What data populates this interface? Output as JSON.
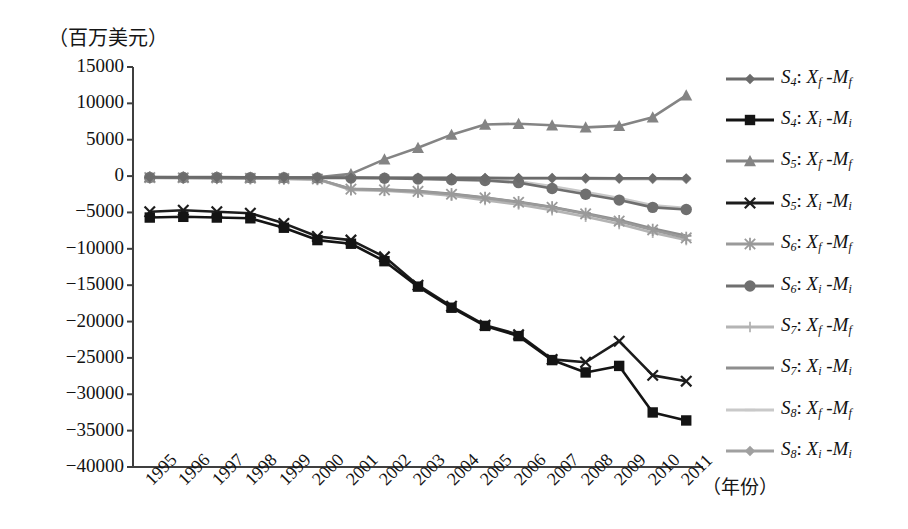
{
  "axis": {
    "unit_label": "（百万美元）",
    "x_axis_title": "（年份）",
    "y_ticks": [
      "15000",
      "10000",
      "5000",
      "0",
      "-5000",
      "-10000",
      "-15000",
      "-20000",
      "-25000",
      "-30000",
      "-35000",
      "-40000"
    ],
    "x_ticks": [
      "1995",
      "1996",
      "1997",
      "1998",
      "1999",
      "2000",
      "2001",
      "2002",
      "2003",
      "2004",
      "2005",
      "2006",
      "2007",
      "2008",
      "2009",
      "2010",
      "2011"
    ]
  },
  "legend": {
    "items": [
      {
        "label": "S4: Xf -Mf",
        "base": "S",
        "sub": "4",
        "num": "X",
        "numsub": "f",
        "den": "M",
        "densub": "f",
        "marker": "diamond",
        "color": "#6b6b6b"
      },
      {
        "label": "S4: Xi -Mi",
        "base": "S",
        "sub": "4",
        "num": "X",
        "numsub": "i",
        "den": "M",
        "densub": "i",
        "marker": "square",
        "color": "#141414"
      },
      {
        "label": "S5: Xf -Mf",
        "base": "S",
        "sub": "5",
        "num": "X",
        "numsub": "f",
        "den": "M",
        "densub": "f",
        "marker": "triangle",
        "color": "#848484"
      },
      {
        "label": "S5: Xi -Mi",
        "base": "S",
        "sub": "5",
        "num": "X",
        "numsub": "i",
        "den": "M",
        "densub": "i",
        "marker": "x",
        "color": "#1c1c1c"
      },
      {
        "label": "S6: Xf -Mf",
        "base": "S",
        "sub": "6",
        "num": "X",
        "numsub": "f",
        "den": "M",
        "densub": "f",
        "marker": "asterisk",
        "color": "#9a9a9a"
      },
      {
        "label": "S6: Xi -Mi",
        "base": "S",
        "sub": "6",
        "num": "X",
        "numsub": "i",
        "den": "M",
        "densub": "i",
        "marker": "circle",
        "color": "#6f6f6f"
      },
      {
        "label": "S7: Xf -Mf",
        "base": "S",
        "sub": "7",
        "num": "X",
        "numsub": "f",
        "den": "M",
        "densub": "f",
        "marker": "plus",
        "color": "#b4b4b4"
      },
      {
        "label": "S7: Xi -Mi",
        "base": "S",
        "sub": "7",
        "num": "X",
        "numsub": "i",
        "den": "M",
        "densub": "i",
        "marker": "line",
        "color": "#8e8e8e"
      },
      {
        "label": "S8: Xf -Mf",
        "base": "S",
        "sub": "8",
        "num": "X",
        "numsub": "f",
        "den": "M",
        "densub": "f",
        "marker": "dash",
        "color": "#c9c9c9"
      },
      {
        "label": "S8: Xi -Mi",
        "base": "S",
        "sub": "8",
        "num": "X",
        "numsub": "i",
        "den": "M",
        "densub": "i",
        "marker": "diamond",
        "color": "#a0a0a0"
      }
    ]
  },
  "chart_data": {
    "type": "line",
    "title": "",
    "xlabel": "（年份）",
    "ylabel": "（百万美元）",
    "ylim": [
      -40000,
      15000
    ],
    "ytick_step": 5000,
    "grid": false,
    "legend_position": "right",
    "x": [
      1995,
      1996,
      1997,
      1998,
      1999,
      2000,
      2001,
      2002,
      2003,
      2004,
      2005,
      2006,
      2007,
      2008,
      2009,
      2010,
      2011
    ],
    "series": [
      {
        "name": "S4: Xf -Mf",
        "marker": "diamond",
        "color": "#6b6b6b",
        "values": [
          -150,
          -160,
          -170,
          -180,
          -190,
          -200,
          -210,
          -220,
          -230,
          -240,
          -250,
          -260,
          -270,
          -280,
          -290,
          -300,
          -310
        ]
      },
      {
        "name": "S4: Xi -Mi",
        "marker": "square",
        "color": "#141414",
        "values": [
          -5700,
          -5600,
          -5700,
          -5800,
          -7100,
          -8800,
          -9300,
          -11700,
          -15200,
          -18100,
          -20600,
          -22000,
          -25300,
          -27000,
          -26100,
          -32500,
          -33600
        ]
      },
      {
        "name": "S5: Xf -Mf",
        "marker": "triangle",
        "color": "#848484",
        "values": [
          -120,
          -130,
          -140,
          -160,
          -170,
          -180,
          300,
          2300,
          3900,
          5700,
          7100,
          7200,
          7000,
          6700,
          6900,
          8100,
          11100
        ]
      },
      {
        "name": "S5: Xi -Mi",
        "marker": "x",
        "color": "#1c1c1c",
        "values": [
          -4900,
          -4700,
          -4900,
          -5100,
          -6500,
          -8300,
          -8800,
          -11100,
          -15000,
          -17900,
          -20500,
          -21800,
          -25200,
          -25600,
          -22700,
          -27400,
          -28200
        ]
      },
      {
        "name": "S6: Xf -Mf",
        "marker": "asterisk",
        "color": "#9a9a9a",
        "values": [
          -200,
          -230,
          -260,
          -300,
          -340,
          -400,
          -1800,
          -1900,
          -2100,
          -2500,
          -3000,
          -3600,
          -4300,
          -5200,
          -6200,
          -7400,
          -8500
        ]
      },
      {
        "name": "S6: Xi -Mi",
        "marker": "circle",
        "color": "#6f6f6f",
        "values": [
          -180,
          -190,
          -200,
          -210,
          -230,
          -250,
          -270,
          -300,
          -400,
          -500,
          -600,
          -900,
          -1700,
          -2500,
          -3300,
          -4300,
          -4600
        ]
      },
      {
        "name": "S7: Xf -Mf",
        "marker": "plus",
        "color": "#b4b4b4",
        "values": [
          -240,
          -260,
          -290,
          -330,
          -380,
          -450,
          -1900,
          -2000,
          -2300,
          -2700,
          -3300,
          -3900,
          -4700,
          -5600,
          -6600,
          -7800,
          -8800
        ]
      },
      {
        "name": "S7: Xi -Mi",
        "marker": "line",
        "color": "#8e8e8e",
        "values": [
          -210,
          -240,
          -270,
          -310,
          -360,
          -420,
          -1750,
          -1850,
          -2050,
          -2450,
          -2950,
          -3550,
          -4250,
          -5100,
          -6050,
          -7200,
          -8200
        ]
      },
      {
        "name": "S8: Xf -Mf",
        "marker": "dash",
        "color": "#c9c9c9",
        "values": [
          -160,
          -170,
          -180,
          -190,
          -200,
          -220,
          -240,
          -260,
          -300,
          -350,
          -420,
          -700,
          -1400,
          -2200,
          -3000,
          -4000,
          -4400
        ]
      },
      {
        "name": "S8: Xi -Mi",
        "marker": "diamond",
        "color": "#a0a0a0",
        "values": [
          -140,
          -150,
          -160,
          -170,
          -180,
          -200,
          -220,
          -240,
          -260,
          -280,
          -300,
          -320,
          -340,
          -360,
          -380,
          -400,
          -420
        ]
      }
    ]
  }
}
